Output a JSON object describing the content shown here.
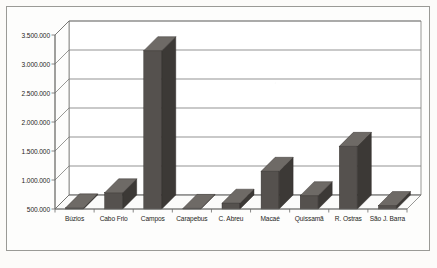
{
  "chart_data": {
    "type": "bar",
    "title": "",
    "subtitle": "",
    "xlabel": "",
    "ylabel": "",
    "categories": [
      "Búzios",
      "Cabo Frio",
      "Campos",
      "Carapebus",
      "C. Abreu",
      "Macaé",
      "Quissamã",
      "R. Ostras",
      "São J. Barra"
    ],
    "values": [
      520000,
      780000,
      3230000,
      510000,
      600000,
      1150000,
      730000,
      1580000,
      560000
    ],
    "series": [
      {
        "name": "",
        "values": [
          520000,
          780000,
          3230000,
          510000,
          600000,
          1150000,
          730000,
          1580000,
          560000
        ]
      }
    ],
    "ylim": [
      500000,
      3500000
    ],
    "ytick_values": [
      500000,
      1000000,
      1500000,
      2000000,
      2500000,
      3000000,
      3500000
    ],
    "ytick_labels": [
      "500.000",
      "1.000.000",
      "1.500.000",
      "2.000.000",
      "2.500.000",
      "3.000.000",
      "3.500.000"
    ],
    "grid": true,
    "grid_axis": "y",
    "legend": false,
    "legend_position": "none",
    "three_d": true,
    "annotations": []
  },
  "style": {
    "bar_front_color": "#55514e",
    "bar_side_color": "#3c3936",
    "bar_top_color": "#6e6a66",
    "plot_background": "#ffffff",
    "wall_color": "#f2f1ef",
    "floor_color": "#e8e7e4",
    "gridline_color": "#808080",
    "axis_color": "#6b6b69",
    "frame_border_color": "#9a9a96",
    "page_background": "#fcfbf9",
    "label_color": "#1d1d1b"
  }
}
